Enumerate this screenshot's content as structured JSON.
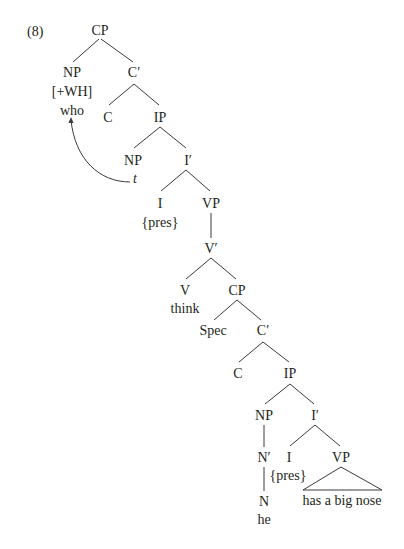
{
  "example_number": "(8)",
  "nodes": [
    {
      "id": "cp1",
      "label": "CP",
      "x": 100,
      "y": 35
    },
    {
      "id": "np1",
      "label": "NP",
      "x": 72,
      "y": 77
    },
    {
      "id": "np1_feat",
      "label": "[+WH]",
      "x": 72,
      "y": 96
    },
    {
      "id": "np1_word",
      "label": "who",
      "x": 72,
      "y": 115
    },
    {
      "id": "cbar1",
      "label": "C′",
      "x": 134,
      "y": 77
    },
    {
      "id": "c1",
      "label": "C",
      "x": 108,
      "y": 122
    },
    {
      "id": "ip1",
      "label": "IP",
      "x": 160,
      "y": 122
    },
    {
      "id": "np2",
      "label": "NP",
      "x": 133,
      "y": 165
    },
    {
      "id": "trace",
      "label": "t",
      "x": 135,
      "y": 183,
      "italic": true
    },
    {
      "id": "ibar1",
      "label": "I′",
      "x": 188,
      "y": 165
    },
    {
      "id": "i1",
      "label": "I",
      "x": 160,
      "y": 208
    },
    {
      "id": "i1_feat",
      "label": "{pres}",
      "x": 160,
      "y": 227
    },
    {
      "id": "vp1",
      "label": "VP",
      "x": 211,
      "y": 208
    },
    {
      "id": "vbar",
      "label": "V′",
      "x": 211,
      "y": 253
    },
    {
      "id": "v",
      "label": "V",
      "x": 185,
      "y": 295
    },
    {
      "id": "v_word",
      "label": "think",
      "x": 185,
      "y": 313
    },
    {
      "id": "cp2",
      "label": "CP",
      "x": 237,
      "y": 295
    },
    {
      "id": "spec",
      "label": "Spec",
      "x": 213,
      "y": 335
    },
    {
      "id": "cbar2",
      "label": "C′",
      "x": 263,
      "y": 335
    },
    {
      "id": "c2",
      "label": "C",
      "x": 238,
      "y": 378
    },
    {
      "id": "ip2",
      "label": "IP",
      "x": 290,
      "y": 378
    },
    {
      "id": "np3",
      "label": "NP",
      "x": 264,
      "y": 420
    },
    {
      "id": "ibar2",
      "label": "I′",
      "x": 315,
      "y": 420
    },
    {
      "id": "nbar",
      "label": "N′",
      "x": 264,
      "y": 462
    },
    {
      "id": "i2",
      "label": "I",
      "x": 289,
      "y": 462
    },
    {
      "id": "i2_feat",
      "label": "{pres}",
      "x": 288,
      "y": 480
    },
    {
      "id": "vp2",
      "label": "VP",
      "x": 341,
      "y": 462
    },
    {
      "id": "vp2_yield",
      "label": "has a big nose",
      "x": 342,
      "y": 505
    },
    {
      "id": "n",
      "label": "N",
      "x": 264,
      "y": 506
    },
    {
      "id": "n_word",
      "label": "he",
      "x": 264,
      "y": 524
    }
  ],
  "edges": [
    {
      "from": "cp1",
      "to": "np1",
      "x1": 99,
      "y1": 39,
      "x2": 73,
      "y2": 62
    },
    {
      "from": "cp1",
      "to": "cbar1",
      "x1": 101,
      "y1": 39,
      "x2": 133,
      "y2": 62
    },
    {
      "from": "cbar1",
      "to": "c1",
      "x1": 134,
      "y1": 84,
      "x2": 109,
      "y2": 105
    },
    {
      "from": "cbar1",
      "to": "ip1",
      "x1": 134,
      "y1": 84,
      "x2": 159,
      "y2": 105
    },
    {
      "from": "ip1",
      "to": "np2",
      "x1": 160,
      "y1": 127,
      "x2": 134,
      "y2": 148
    },
    {
      "from": "ip1",
      "to": "ibar1",
      "x1": 160,
      "y1": 127,
      "x2": 186,
      "y2": 148
    },
    {
      "from": "ibar1",
      "to": "i1",
      "x1": 186,
      "y1": 170,
      "x2": 161,
      "y2": 191
    },
    {
      "from": "ibar1",
      "to": "vp1",
      "x1": 186,
      "y1": 170,
      "x2": 210,
      "y2": 191
    },
    {
      "from": "vp1",
      "to": "vbar",
      "x1": 211,
      "y1": 213,
      "x2": 211,
      "y2": 238
    },
    {
      "from": "vbar",
      "to": "v",
      "x1": 211,
      "y1": 258,
      "x2": 186,
      "y2": 279
    },
    {
      "from": "vbar",
      "to": "cp2",
      "x1": 211,
      "y1": 258,
      "x2": 236,
      "y2": 279
    },
    {
      "from": "cp2",
      "to": "spec",
      "x1": 237,
      "y1": 300,
      "x2": 214,
      "y2": 320
    },
    {
      "from": "cp2",
      "to": "cbar2",
      "x1": 237,
      "y1": 300,
      "x2": 261,
      "y2": 320
    },
    {
      "from": "cbar2",
      "to": "c2",
      "x1": 263,
      "y1": 342,
      "x2": 239,
      "y2": 362
    },
    {
      "from": "cbar2",
      "to": "ip2",
      "x1": 263,
      "y1": 342,
      "x2": 289,
      "y2": 362
    },
    {
      "from": "ip2",
      "to": "np3",
      "x1": 290,
      "y1": 384,
      "x2": 265,
      "y2": 404
    },
    {
      "from": "ip2",
      "to": "ibar2",
      "x1": 290,
      "y1": 384,
      "x2": 314,
      "y2": 404
    },
    {
      "from": "np3",
      "to": "nbar",
      "x1": 264,
      "y1": 425,
      "x2": 264,
      "y2": 447
    },
    {
      "from": "ibar2",
      "to": "i2",
      "x1": 315,
      "y1": 425,
      "x2": 290,
      "y2": 446
    },
    {
      "from": "ibar2",
      "to": "vp2",
      "x1": 315,
      "y1": 425,
      "x2": 340,
      "y2": 446
    },
    {
      "from": "nbar",
      "to": "n",
      "x1": 264,
      "y1": 467,
      "x2": 264,
      "y2": 491
    }
  ],
  "triangle": {
    "node": "vp2",
    "apex": [
      341,
      467
    ],
    "base_left": [
      303,
      490
    ],
    "base_right": [
      382,
      490
    ]
  },
  "movement_arrow": {
    "from": "trace",
    "to": "np1_word",
    "path": "M 130 182 C 100 182, 75 160, 71 120",
    "head": [
      71,
      117
    ]
  }
}
